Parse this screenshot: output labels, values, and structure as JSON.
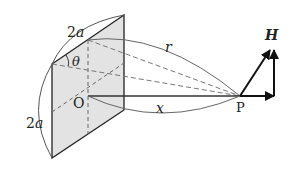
{
  "diagram": {
    "labels": {
      "top_side": "2a",
      "left_side": "2a",
      "angle": "θ",
      "distance_r": "r",
      "distance_x": "x",
      "center": "O",
      "point": "P",
      "field": "H"
    },
    "colors": {
      "plate_fill": "#e3e3e3",
      "line": "#222222",
      "dashed": "#777777",
      "arc": "#666666"
    }
  }
}
